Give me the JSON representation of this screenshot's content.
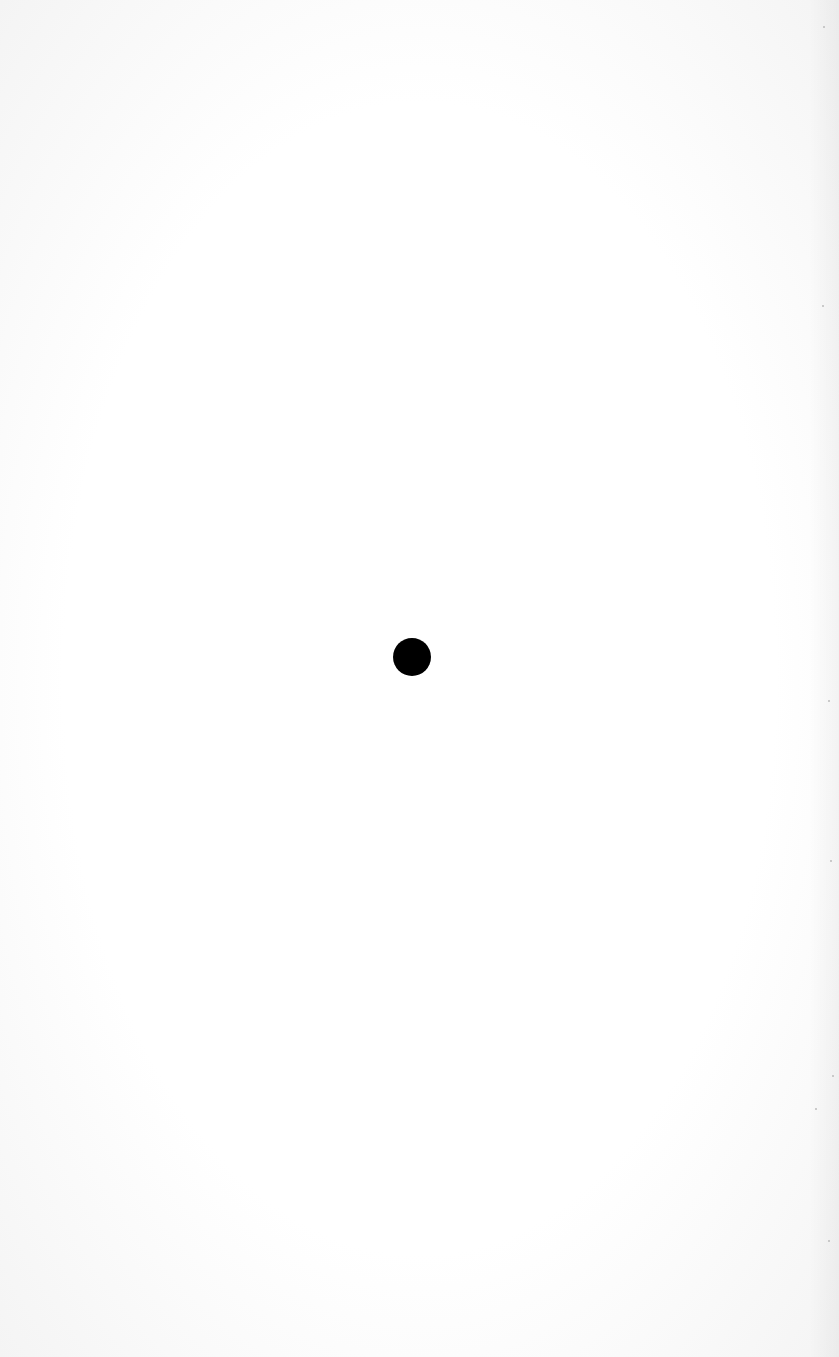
{
  "page": {
    "type": "scanned blank page",
    "background": "#fdfdfd"
  },
  "dot": {
    "cx": 412,
    "cy": 657,
    "radius": 19,
    "color": "#000000"
  },
  "specks": [
    {
      "x": 823,
      "y": 26
    },
    {
      "x": 822,
      "y": 305
    },
    {
      "x": 828,
      "y": 700
    },
    {
      "x": 830,
      "y": 860
    },
    {
      "x": 832,
      "y": 1075
    },
    {
      "x": 815,
      "y": 1108
    },
    {
      "x": 828,
      "y": 1240
    }
  ]
}
